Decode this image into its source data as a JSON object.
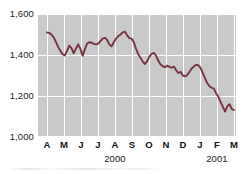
{
  "chart_data": {
    "type": "line",
    "title": "",
    "subtitle": "",
    "xlabel": "",
    "ylabel": "",
    "ylim": [
      1000,
      1600
    ],
    "y_ticks": [
      1000,
      1200,
      1400,
      1600
    ],
    "y_tick_labels": [
      "1,000",
      "1,200",
      "1,400",
      "1,600"
    ],
    "grid": true,
    "legend": "none",
    "x_tick_labels": [
      "A",
      "M",
      "J",
      "J",
      "A",
      "S",
      "O",
      "N",
      "D",
      "J",
      "F",
      "M"
    ],
    "x_group_labels": [
      "2000",
      "2001"
    ],
    "x_axis_note": "Monthly tick marks from April 2000 through March 2001; weekly observations plotted",
    "series": [
      {
        "name": "index",
        "color": "#7a3340",
        "values": [
          1510,
          1508,
          1500,
          1486,
          1464,
          1440,
          1420,
          1404,
          1398,
          1420,
          1446,
          1434,
          1408,
          1432,
          1452,
          1430,
          1396,
          1428,
          1456,
          1462,
          1460,
          1454,
          1452,
          1456,
          1468,
          1480,
          1484,
          1474,
          1452,
          1442,
          1462,
          1480,
          1492,
          1500,
          1510,
          1514,
          1496,
          1482,
          1480,
          1462,
          1430,
          1404,
          1386,
          1368,
          1356,
          1370,
          1392,
          1406,
          1410,
          1396,
          1372,
          1354,
          1346,
          1340,
          1348,
          1342,
          1338,
          1344,
          1326,
          1312,
          1318,
          1300,
          1296,
          1302,
          1318,
          1334,
          1344,
          1352,
          1350,
          1336,
          1312,
          1286,
          1262,
          1248,
          1240,
          1236,
          1212,
          1196,
          1170,
          1148,
          1124,
          1150,
          1160,
          1136,
          1132
        ]
      }
    ]
  },
  "axis": {
    "y_label_1600": "1,600",
    "y_label_1400": "1,400",
    "y_label_1200": "1,200",
    "y_label_1000": "1,000"
  },
  "months": {
    "m0": "A",
    "m1": "M",
    "m2": "J",
    "m3": "J",
    "m4": "A",
    "m5": "S",
    "m6": "O",
    "m7": "N",
    "m8": "D",
    "m9": "J",
    "m10": "F",
    "m11": "M"
  },
  "years": {
    "y2000": "2000",
    "y2001": "2001"
  },
  "colors": {
    "line": "#7a3340",
    "panel": "#c9c9c9",
    "grid": "#ffffff",
    "text": "#1a1a1a",
    "background": "#ffffff"
  }
}
